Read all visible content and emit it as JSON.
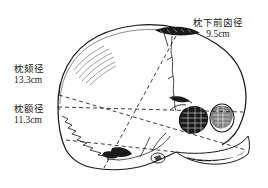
{
  "figure": {
    "title_present": false,
    "background_color": "#ffffff",
    "ink_color": "#1a1a1a"
  },
  "labels": {
    "suboccipitobregmatic": {
      "name_cn": "枕下前囟径",
      "value": "9.5cm"
    },
    "occipitomental": {
      "name_cn": "枕颏径",
      "value": "13.3cm"
    },
    "occipitofrontal": {
      "name_cn": "枕额径",
      "value": "11.3cm"
    }
  },
  "icons": {
    "skull_outline": "fetal-skull-icon",
    "anterior_fontanelle": "fontanelle-icon",
    "orbit": "eye-socket-icon",
    "ear": "ear-icon"
  }
}
